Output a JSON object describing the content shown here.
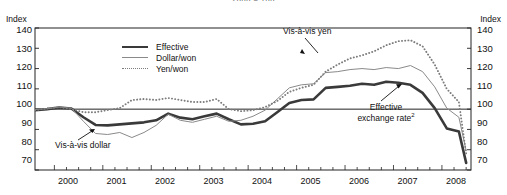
{
  "title_clipped": "2000 = 100",
  "axis": {
    "y_unit_left": "Index",
    "y_unit_right": "Index",
    "y_ticks": [
      "140",
      "130",
      "120",
      "110",
      "100",
      "90",
      "80",
      "70"
    ],
    "x_ticks": [
      "2000",
      "2001",
      "2002",
      "2003",
      "2004",
      "2005",
      "2006",
      "2007",
      "2008"
    ]
  },
  "legend": {
    "items": [
      {
        "label": "Effective",
        "style": "thick-solid",
        "color": "#3a3a3a"
      },
      {
        "label": "Dollar/won",
        "style": "thin-solid",
        "color": "#8a8a8a"
      },
      {
        "label": "Yen/won",
        "style": "dotted",
        "color": "#7d7d7d"
      }
    ]
  },
  "annotations": {
    "vis_a_vis_yen": "Vis-à-vis yen",
    "vis_a_vis_dollar": "Vis-à-vis dollar",
    "effective_line1": "Effective",
    "effective_line2": "exchange rate",
    "effective_superscript": "2"
  },
  "chart_data": {
    "type": "line",
    "title": "2000 = 100",
    "xlabel": "",
    "ylabel": "Index",
    "ylim": [
      70,
      140
    ],
    "xlim": [
      1999.6,
      2008.6
    ],
    "grid": false,
    "reference_line": 100,
    "legend_position": "top-center-left",
    "x": [
      1999.6,
      1999.85,
      2000.1,
      2000.35,
      2000.6,
      2000.85,
      2001.1,
      2001.35,
      2001.6,
      2001.85,
      2002.1,
      2002.35,
      2002.6,
      2002.85,
      2003.1,
      2003.35,
      2003.6,
      2003.85,
      2004.1,
      2004.35,
      2004.6,
      2004.85,
      2005.1,
      2005.35,
      2005.6,
      2005.85,
      2006.1,
      2006.35,
      2006.6,
      2006.85,
      2007.1,
      2007.35,
      2007.6,
      2007.85,
      2008.1,
      2008.35,
      2008.5
    ],
    "series": [
      {
        "name": "Effective",
        "style": "thick-solid",
        "color": "#3a3a3a",
        "values": [
          99.5,
          100.0,
          100.8,
          100.3,
          96.0,
          92.2,
          92.0,
          92.5,
          93.0,
          93.5,
          94.5,
          97.8,
          95.8,
          95.0,
          96.5,
          97.8,
          95.0,
          92.5,
          92.8,
          94.0,
          98.5,
          103.0,
          104.5,
          104.8,
          110.5,
          111.0,
          111.5,
          112.5,
          112.0,
          113.5,
          113.0,
          112.0,
          108.0,
          100.5,
          90.5,
          89.0,
          73.5
        ]
      },
      {
        "name": "Dollar/won",
        "style": "thin-solid",
        "color": "#8a8a8a",
        "values": [
          99.8,
          100.2,
          101.0,
          100.5,
          94.0,
          88.0,
          87.5,
          88.5,
          86.0,
          88.5,
          92.0,
          97.5,
          94.5,
          93.5,
          95.0,
          96.5,
          94.0,
          94.5,
          96.5,
          99.5,
          105.0,
          110.5,
          112.0,
          112.5,
          118.0,
          118.5,
          119.5,
          120.0,
          119.5,
          120.5,
          120.0,
          121.5,
          118.5,
          111.0,
          100.5,
          96.0,
          79.5
        ]
      },
      {
        "name": "Yen/won",
        "style": "dotted",
        "color": "#7d7d7d",
        "values": [
          99.5,
          100.3,
          101.0,
          100.0,
          98.5,
          98.5,
          99.5,
          100.5,
          104.5,
          105.0,
          104.5,
          105.5,
          104.5,
          103.5,
          103.5,
          105.0,
          100.0,
          99.0,
          99.5,
          101.0,
          104.0,
          108.5,
          110.5,
          112.0,
          118.5,
          122.0,
          125.0,
          126.5,
          128.5,
          131.5,
          133.5,
          134.0,
          131.0,
          122.0,
          110.0,
          103.5,
          78.0
        ]
      }
    ]
  }
}
